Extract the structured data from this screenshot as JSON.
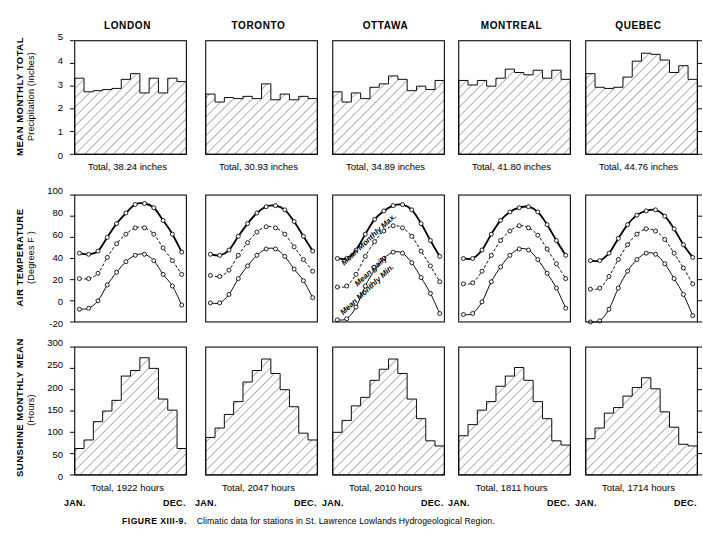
{
  "figure": {
    "number": "FIGURE XIII-9.",
    "caption": "Climatic data for stations in St. Lawrence Lowlands Hydrogeological Region."
  },
  "stations": [
    "LONDON",
    "TORONTO",
    "OTTAWA",
    "MONTREAL",
    "QUEBEC"
  ],
  "month_axis": {
    "start": "JAN.",
    "end": "DEC."
  },
  "rows": {
    "precipitation": {
      "title_line1": "MEAN MONTHLY TOTAL",
      "title_line2": "Precipitation (Inches)",
      "ticks": [
        "5",
        "4",
        "3",
        "2",
        "1",
        "0"
      ],
      "totals": [
        "Total, 38.24 inches",
        "Total, 30.93 inches",
        "Total, 34.89 inches",
        "Total, 41.80 inches",
        "Total, 44.76 inches"
      ]
    },
    "temperature": {
      "title_line1": "AIR TEMPERATURE",
      "title_line2": "(Degrees F )",
      "ticks": [
        "100",
        "80",
        "60",
        "40",
        "20",
        "0",
        "-20"
      ],
      "curve_labels": [
        "Mean Monthly Max.",
        "Mean Daily",
        "Mean Monthly Min."
      ]
    },
    "sunshine": {
      "title_line1": "SUNSHINE MONTHLY MEAN",
      "title_line2": "(Hours)",
      "ticks": [
        "300",
        "250",
        "200",
        "150",
        "100",
        "50",
        "0"
      ],
      "totals": [
        "Total, 1922 hours",
        "Total, 2047 hours",
        "Total, 2010 hours",
        "Total, 1811 hours",
        "Total, 1714 hours"
      ]
    }
  },
  "chart_data": [
    {
      "type": "bar",
      "title": "LONDON",
      "panel": "precipitation",
      "ylabel": "Mean Monthly Total Precipitation (Inches)",
      "xlabel": "",
      "ylim": [
        0,
        5
      ],
      "yticks": [
        0,
        1,
        2,
        3,
        4,
        5
      ],
      "grid": false,
      "categories": [
        "JAN",
        "FEB",
        "MAR",
        "APR",
        "MAY",
        "JUN",
        "JUL",
        "AUG",
        "SEP",
        "OCT",
        "NOV",
        "DEC"
      ],
      "values": [
        3.35,
        2.75,
        2.8,
        2.85,
        2.9,
        3.3,
        3.55,
        2.7,
        3.35,
        2.7,
        3.35,
        3.2
      ],
      "annotation": "Total, 38.24 inches"
    },
    {
      "type": "bar",
      "title": "TORONTO",
      "panel": "precipitation",
      "ylabel": "Mean Monthly Total Precipitation (Inches)",
      "xlabel": "",
      "ylim": [
        0,
        5
      ],
      "yticks": [
        0,
        1,
        2,
        3,
        4,
        5
      ],
      "grid": false,
      "categories": [
        "JAN",
        "FEB",
        "MAR",
        "APR",
        "MAY",
        "JUN",
        "JUL",
        "AUG",
        "SEP",
        "OCT",
        "NOV",
        "DEC"
      ],
      "values": [
        2.65,
        2.3,
        2.5,
        2.45,
        2.55,
        2.45,
        3.1,
        2.4,
        2.65,
        2.4,
        2.55,
        2.45
      ],
      "annotation": "Total, 30.93 inches"
    },
    {
      "type": "bar",
      "title": "OTTAWA",
      "panel": "precipitation",
      "ylabel": "Mean Monthly Total Precipitation (Inches)",
      "xlabel": "",
      "ylim": [
        0,
        5
      ],
      "yticks": [
        0,
        1,
        2,
        3,
        4,
        5
      ],
      "grid": false,
      "categories": [
        "JAN",
        "FEB",
        "MAR",
        "APR",
        "MAY",
        "JUN",
        "JUL",
        "AUG",
        "SEP",
        "OCT",
        "NOV",
        "DEC"
      ],
      "values": [
        2.75,
        2.3,
        2.7,
        2.45,
        2.95,
        3.1,
        3.45,
        3.3,
        2.8,
        3.0,
        2.85,
        3.25
      ],
      "annotation": "Total, 34.89 inches"
    },
    {
      "type": "bar",
      "title": "MONTREAL",
      "panel": "precipitation",
      "ylabel": "Mean Monthly Total Precipitation (Inches)",
      "xlabel": "",
      "ylim": [
        0,
        5
      ],
      "yticks": [
        0,
        1,
        2,
        3,
        4,
        5
      ],
      "grid": false,
      "categories": [
        "JAN",
        "FEB",
        "MAR",
        "APR",
        "MAY",
        "JUN",
        "JUL",
        "AUG",
        "SEP",
        "OCT",
        "NOV",
        "DEC"
      ],
      "values": [
        3.25,
        3.05,
        3.25,
        3.0,
        3.35,
        3.75,
        3.6,
        3.5,
        3.7,
        3.35,
        3.7,
        3.3
      ],
      "annotation": "Total, 41.80 inches"
    },
    {
      "type": "bar",
      "title": "QUEBEC",
      "panel": "precipitation",
      "ylabel": "Mean Monthly Total Precipitation (Inches)",
      "xlabel": "",
      "ylim": [
        0,
        5
      ],
      "yticks": [
        0,
        1,
        2,
        3,
        4,
        5
      ],
      "grid": false,
      "categories": [
        "JAN",
        "FEB",
        "MAR",
        "APR",
        "MAY",
        "JUN",
        "JUL",
        "AUG",
        "SEP",
        "OCT",
        "NOV",
        "DEC"
      ],
      "values": [
        3.55,
        2.95,
        2.9,
        2.95,
        3.4,
        4.1,
        4.45,
        4.4,
        4.15,
        3.6,
        3.9,
        3.3
      ],
      "annotation": "Total, 44.76 inches"
    },
    {
      "type": "line",
      "title": "LONDON",
      "panel": "temperature",
      "ylabel": "Air Temperature (Degrees F)",
      "xlabel": "",
      "ylim": [
        -20,
        100
      ],
      "yticks": [
        -20,
        0,
        20,
        40,
        60,
        80,
        100
      ],
      "grid": false,
      "categories": [
        "JAN",
        "FEB",
        "MAR",
        "APR",
        "MAY",
        "JUN",
        "JUL",
        "AUG",
        "SEP",
        "OCT",
        "NOV",
        "DEC"
      ],
      "series": [
        {
          "name": "Mean Monthly Max.",
          "values": [
            45,
            44,
            47,
            60,
            73,
            83,
            91,
            92,
            88,
            76,
            63,
            46
          ]
        },
        {
          "name": "Mean Daily",
          "values": [
            21,
            21,
            26,
            41,
            54,
            63,
            69,
            69,
            63,
            50,
            38,
            25
          ]
        },
        {
          "name": "Mean Monthly Min.",
          "values": [
            -8,
            -7,
            0,
            15,
            27,
            37,
            43,
            44,
            38,
            25,
            14,
            -4
          ]
        }
      ]
    },
    {
      "type": "line",
      "title": "TORONTO",
      "panel": "temperature",
      "ylabel": "Air Temperature (Degrees F)",
      "xlabel": "",
      "ylim": [
        -20,
        100
      ],
      "yticks": [
        -20,
        0,
        20,
        40,
        60,
        80,
        100
      ],
      "grid": false,
      "categories": [
        "JAN",
        "FEB",
        "MAR",
        "APR",
        "MAY",
        "JUN",
        "JUL",
        "AUG",
        "SEP",
        "OCT",
        "NOV",
        "DEC"
      ],
      "series": [
        {
          "name": "Mean Monthly Max.",
          "values": [
            44,
            43,
            48,
            61,
            73,
            83,
            89,
            90,
            86,
            75,
            61,
            47
          ]
        },
        {
          "name": "Mean Daily",
          "values": [
            24,
            23,
            29,
            43,
            55,
            65,
            70,
            69,
            63,
            51,
            39,
            28
          ]
        },
        {
          "name": "Mean Monthly Min.",
          "values": [
            -2,
            -2,
            6,
            21,
            33,
            43,
            49,
            49,
            42,
            30,
            19,
            3
          ]
        }
      ]
    },
    {
      "type": "line",
      "title": "OTTAWA",
      "panel": "temperature",
      "ylabel": "Air Temperature (Degrees F)",
      "xlabel": "",
      "ylim": [
        -20,
        100
      ],
      "yticks": [
        -20,
        0,
        20,
        40,
        60,
        80,
        100
      ],
      "grid": false,
      "categories": [
        "JAN",
        "FEB",
        "MAR",
        "APR",
        "MAY",
        "JUN",
        "JUL",
        "AUG",
        "SEP",
        "OCT",
        "NOV",
        "DEC"
      ],
      "series": [
        {
          "name": "Mean Monthly Max.",
          "values": [
            40,
            40,
            48,
            63,
            77,
            85,
            90,
            91,
            86,
            73,
            57,
            42
          ]
        },
        {
          "name": "Mean Daily",
          "values": [
            13,
            14,
            25,
            42,
            56,
            66,
            71,
            69,
            61,
            47,
            33,
            18
          ]
        },
        {
          "name": "Mean Monthly Min.",
          "values": [
            -18,
            -17,
            -6,
            14,
            29,
            40,
            46,
            45,
            36,
            22,
            7,
            -12
          ]
        }
      ]
    },
    {
      "type": "line",
      "title": "MONTREAL",
      "panel": "temperature",
      "ylabel": "Air Temperature (Degrees F)",
      "xlabel": "",
      "ylim": [
        -20,
        100
      ],
      "yticks": [
        -20,
        0,
        20,
        40,
        60,
        80,
        100
      ],
      "grid": false,
      "categories": [
        "JAN",
        "FEB",
        "MAR",
        "APR",
        "MAY",
        "JUN",
        "JUL",
        "AUG",
        "SEP",
        "OCT",
        "NOV",
        "DEC"
      ],
      "series": [
        {
          "name": "Mean Monthly Max.",
          "values": [
            40,
            40,
            48,
            63,
            76,
            84,
            88,
            89,
            84,
            72,
            57,
            43
          ]
        },
        {
          "name": "Mean Daily",
          "values": [
            16,
            17,
            28,
            43,
            57,
            66,
            71,
            69,
            62,
            49,
            35,
            21
          ]
        },
        {
          "name": "Mean Monthly Min.",
          "values": [
            -13,
            -12,
            -1,
            18,
            32,
            43,
            49,
            48,
            39,
            26,
            12,
            -7
          ]
        }
      ]
    },
    {
      "type": "line",
      "title": "QUEBEC",
      "panel": "temperature",
      "ylabel": "Air Temperature (Degrees F)",
      "xlabel": "",
      "ylim": [
        -20,
        100
      ],
      "yticks": [
        -20,
        0,
        20,
        40,
        60,
        80,
        100
      ],
      "grid": false,
      "categories": [
        "JAN",
        "FEB",
        "MAR",
        "APR",
        "MAY",
        "JUN",
        "JUL",
        "AUG",
        "SEP",
        "OCT",
        "NOV",
        "DEC"
      ],
      "series": [
        {
          "name": "Mean Monthly Max.",
          "values": [
            38,
            38,
            45,
            59,
            72,
            81,
            85,
            86,
            80,
            68,
            53,
            41
          ]
        },
        {
          "name": "Mean Daily",
          "values": [
            11,
            12,
            23,
            39,
            53,
            63,
            68,
            66,
            58,
            45,
            31,
            16
          ]
        },
        {
          "name": "Mean Monthly Min.",
          "values": [
            -20,
            -19,
            -8,
            12,
            28,
            39,
            45,
            44,
            35,
            21,
            6,
            -14
          ]
        }
      ]
    },
    {
      "type": "bar",
      "title": "LONDON",
      "panel": "sunshine",
      "ylabel": "Sunshine Monthly Mean (Hours)",
      "xlabel": "",
      "ylim": [
        0,
        300
      ],
      "yticks": [
        0,
        50,
        100,
        150,
        200,
        250,
        300
      ],
      "grid": false,
      "categories": [
        "JAN",
        "FEB",
        "MAR",
        "APR",
        "MAY",
        "JUN",
        "JUL",
        "AUG",
        "SEP",
        "OCT",
        "NOV",
        "DEC"
      ],
      "values": [
        62,
        82,
        125,
        150,
        175,
        232,
        245,
        275,
        250,
        178,
        152,
        62
      ],
      "annotation": "Total, 1922 hours"
    },
    {
      "type": "bar",
      "title": "TORONTO",
      "panel": "sunshine",
      "ylabel": "Sunshine Monthly Mean (Hours)",
      "xlabel": "",
      "ylim": [
        0,
        300
      ],
      "yticks": [
        0,
        50,
        100,
        150,
        200,
        250,
        300
      ],
      "grid": false,
      "categories": [
        "JAN",
        "FEB",
        "MAR",
        "APR",
        "MAY",
        "JUN",
        "JUL",
        "AUG",
        "SEP",
        "OCT",
        "NOV",
        "DEC"
      ],
      "values": [
        88,
        110,
        142,
        172,
        218,
        245,
        272,
        238,
        200,
        160,
        98,
        82
      ],
      "annotation": "Total, 2047 hours"
    },
    {
      "type": "bar",
      "title": "OTTAWA",
      "panel": "sunshine",
      "ylabel": "Sunshine Monthly Mean (Hours)",
      "xlabel": "",
      "ylim": [
        0,
        300
      ],
      "yticks": [
        0,
        50,
        100,
        150,
        200,
        250,
        300
      ],
      "grid": false,
      "categories": [
        "JAN",
        "FEB",
        "MAR",
        "APR",
        "MAY",
        "JUN",
        "JUL",
        "AUG",
        "SEP",
        "OCT",
        "NOV",
        "DEC"
      ],
      "values": [
        100,
        128,
        162,
        182,
        222,
        248,
        272,
        238,
        178,
        132,
        80,
        68
      ],
      "annotation": "Total, 2010 hours"
    },
    {
      "type": "bar",
      "title": "MONTREAL",
      "panel": "sunshine",
      "ylabel": "Sunshine Monthly Mean (Hours)",
      "xlabel": "",
      "ylim": [
        0,
        300
      ],
      "yticks": [
        0,
        50,
        100,
        150,
        200,
        250,
        300
      ],
      "grid": false,
      "categories": [
        "JAN",
        "FEB",
        "MAR",
        "APR",
        "MAY",
        "JUN",
        "JUL",
        "AUG",
        "SEP",
        "OCT",
        "NOV",
        "DEC"
      ],
      "values": [
        92,
        118,
        152,
        172,
        208,
        232,
        252,
        222,
        172,
        132,
        80,
        70
      ],
      "annotation": "Total, 1811 hours"
    },
    {
      "type": "bar",
      "title": "QUEBEC",
      "panel": "sunshine",
      "ylabel": "Sunshine Monthly Mean (Hours)",
      "xlabel": "",
      "ylim": [
        0,
        300
      ],
      "yticks": [
        0,
        50,
        100,
        150,
        200,
        250,
        300
      ],
      "grid": false,
      "categories": [
        "JAN",
        "FEB",
        "MAR",
        "APR",
        "MAY",
        "JUN",
        "JUL",
        "AUG",
        "SEP",
        "OCT",
        "NOV",
        "DEC"
      ],
      "values": [
        85,
        110,
        145,
        158,
        185,
        205,
        228,
        202,
        148,
        112,
        72,
        68
      ],
      "annotation": "Total, 1714 hours"
    }
  ]
}
